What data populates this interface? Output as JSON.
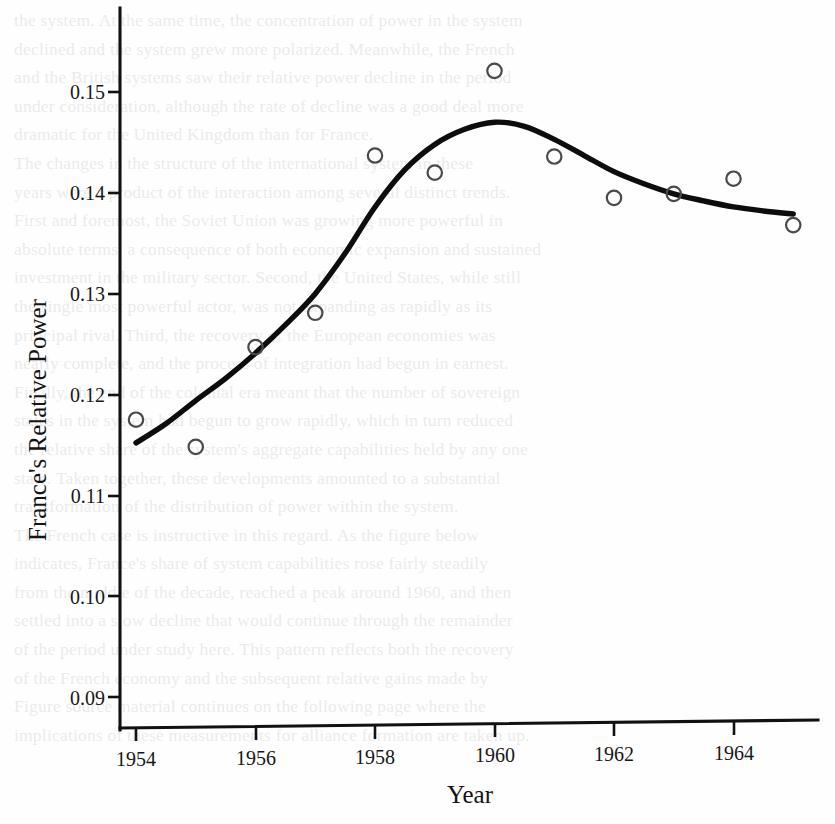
{
  "page": {
    "background_color": "#fefefe",
    "ink_color": "#111111",
    "marker_color": "#4a4a4a"
  },
  "chart_data": {
    "type": "scatter",
    "title": "",
    "subtitle": "",
    "xlabel": "Year",
    "ylabel": "France's Relative Power",
    "xlim": [
      1953.6,
      1965.4
    ],
    "ylim": [
      0.0855,
      0.1545
    ],
    "grid": false,
    "legend": null,
    "x_ticks": [
      1954,
      1956,
      1958,
      1960,
      1962,
      1964
    ],
    "x_tick_labels": [
      "1954",
      "1956",
      "1958",
      "1960",
      "1962",
      "1964"
    ],
    "y_ticks": [
      0.09,
      0.1,
      0.11,
      0.12,
      0.13,
      0.14,
      0.15
    ],
    "y_tick_labels": [
      "0.09",
      "0.10",
      "0.11",
      "0.12",
      "0.13",
      "0.14",
      "0.15"
    ],
    "x": [
      1954,
      1955,
      1956,
      1957,
      1958,
      1959,
      1960,
      1961,
      1962,
      1963,
      1964,
      1965
    ],
    "values": [
      0.1175,
      0.1148,
      0.1247,
      0.1281,
      0.1437,
      0.142,
      0.1521,
      0.1436,
      0.1395,
      0.1399,
      0.1414,
      0.1368
    ],
    "series": [
      {
        "name": "France's Relative Power (observed)",
        "marker": "open-circle",
        "x": [
          1954,
          1955,
          1956,
          1957,
          1958,
          1959,
          1960,
          1961,
          1962,
          1963,
          1964,
          1965
        ],
        "values": [
          0.1175,
          0.1148,
          0.1247,
          0.1281,
          0.1437,
          0.142,
          0.1521,
          0.1436,
          0.1395,
          0.1399,
          0.1414,
          0.1368
        ]
      },
      {
        "name": "Smoothed trend",
        "marker": "none",
        "style": "solid-thick-line",
        "x": [
          1954,
          1954.5,
          1955,
          1955.5,
          1956,
          1956.5,
          1957,
          1957.5,
          1958,
          1958.5,
          1959,
          1959.5,
          1960,
          1960.5,
          1961,
          1961.5,
          1962,
          1962.5,
          1963,
          1963.5,
          1964,
          1964.5,
          1965
        ],
        "values": [
          0.1152,
          0.1171,
          0.1194,
          0.1216,
          0.1241,
          0.1269,
          0.13,
          0.134,
          0.1386,
          0.1423,
          0.1448,
          0.1463,
          0.147,
          0.1466,
          0.1453,
          0.1437,
          0.1421,
          0.1409,
          0.1399,
          0.1392,
          0.1386,
          0.1382,
          0.1379
        ]
      }
    ]
  },
  "bleed_text": {
    "lines": [
      "the system. At the same time, the concentration of power in the system",
      "declined and the system grew more polarized. Meanwhile, the French",
      "and the British systems saw their relative power decline in the period",
      "under consideration, although the rate of decline was a good deal more",
      "dramatic for the United Kingdom than for France.",
      "The changes in the structure of the international system in these",
      "years were a product of the interaction among several distinct trends.",
      "First and foremost, the Soviet Union was growing more powerful in",
      "absolute terms, a consequence of both economic expansion and sustained",
      "investment in the military sector. Second, the United States, while still",
      "the single most powerful actor, was not expanding as rapidly as its",
      "principal rival. Third, the recovery of the European economies was",
      "nearly complete, and the process of integration had begun in earnest.",
      "Finally, the end of the colonial era meant that the number of sovereign",
      "states in the system had begun to grow rapidly, which in turn reduced",
      "the relative share of the system's aggregate capabilities held by any one",
      "state. Taken together, these developments amounted to a substantial",
      "transformation of the distribution of power within the system.",
      "The French case is instructive in this regard. As the figure below",
      "indicates, France's share of system capabilities rose fairly steadily",
      "from the middle of the decade, reached a peak around 1960, and then",
      "settled into a slow decline that would continue through the remainder",
      "of the period under study here. This pattern reflects both the recovery",
      "of the French economy and the subsequent relative gains made by",
      "other states in the system during the years that followed."
    ],
    "footer_lines": [
      "Figure source material continues on the following page where the",
      "implications of these measurements for alliance formation are taken up."
    ]
  }
}
